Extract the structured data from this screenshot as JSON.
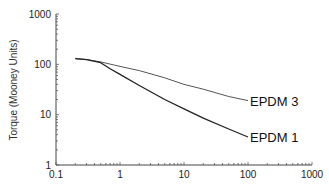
{
  "chart_data": {
    "type": "line",
    "title": "",
    "xlabel": "",
    "ylabel": "Torque (Mooney Units)",
    "xscale": "log",
    "yscale": "log",
    "xlim": [
      0.1,
      1000
    ],
    "ylim": [
      1,
      1000
    ],
    "grid": false,
    "legend": "inline-labels-at-line-ends",
    "x_tick_labels": [
      "0.1",
      "1",
      "10",
      "100",
      "1000"
    ],
    "y_tick_labels": [
      "1",
      "10",
      "100",
      "1000"
    ],
    "x_ticks": [
      0.1,
      1,
      10,
      100,
      1000
    ],
    "y_ticks": [
      1,
      10,
      100,
      1000
    ],
    "series": [
      {
        "name": "EPDM 3",
        "label": "EPDM 3",
        "color": "#555555",
        "x": [
          0.2,
          0.3,
          0.5,
          1,
          2,
          5,
          10,
          20,
          50,
          100
        ],
        "y": [
          130,
          125,
          112,
          91,
          75,
          54,
          40,
          32,
          23,
          19
        ]
      },
      {
        "name": "EPDM 1",
        "label": "EPDM 1",
        "color": "#222222",
        "x": [
          0.2,
          0.3,
          0.5,
          0.7,
          1,
          2,
          5,
          10,
          20,
          50,
          100
        ],
        "y": [
          130,
          124,
          108,
          82,
          63,
          38,
          20,
          13,
          8.5,
          5.2,
          3.6
        ]
      }
    ]
  }
}
